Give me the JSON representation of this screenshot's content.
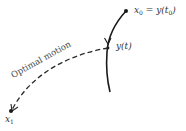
{
  "diagram": {
    "labels": {
      "x0_main": "x",
      "x0_sub": "0",
      "x0_eq": " = y(t",
      "x0_tsub": "0",
      "x0_close": ")",
      "yt": "y(t)",
      "motion": "Optimal motion",
      "x1_main": "x",
      "x1_sub": "1"
    },
    "colors": {
      "stroke": "#1a1a1a",
      "dashed": "#2a2a2a"
    }
  }
}
